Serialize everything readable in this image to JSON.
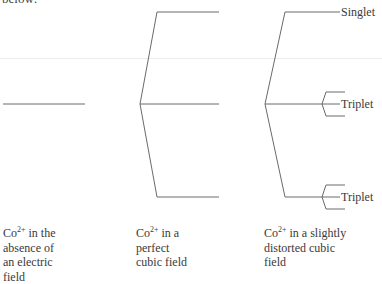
{
  "intro_text": "below:",
  "levels": {
    "right": {
      "labels": [
        "Singlet",
        "Triplet",
        "Triplet"
      ]
    }
  },
  "captions": [
    {
      "ion": "Co",
      "charge": "2+",
      "lines": [
        "in the",
        "absence of",
        "an electric",
        "field"
      ]
    },
    {
      "ion": "Co",
      "charge": "2+",
      "lines": [
        "in a",
        "perfect",
        "cubic field"
      ]
    },
    {
      "ion": "Co",
      "charge": "2+",
      "lines": [
        "in a slightly",
        "distorted cubic",
        "field"
      ]
    }
  ],
  "colors": {
    "line": "#6a6a6a",
    "text": "#3a3a3a"
  }
}
